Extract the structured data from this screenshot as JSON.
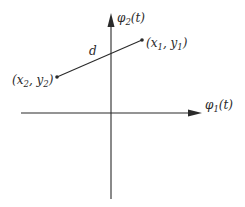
{
  "diagram": {
    "type": "signal-space-2d",
    "axes": {
      "horizontal": {
        "label_base": "φ",
        "label_sub": "1",
        "label_arg": "(t)",
        "from": [
          21,
          113
        ],
        "to": [
          202,
          113
        ]
      },
      "vertical": {
        "label_base": "φ",
        "label_sub": "2",
        "label_arg": "(t)",
        "from": [
          111,
          199
        ],
        "to": [
          111,
          13
        ]
      }
    },
    "points": [
      {
        "id": "p1",
        "label_open": "(",
        "x_base": "x",
        "x_sub": "1",
        "sep": ", ",
        "y_base": "y",
        "y_sub": "1",
        "label_close": ")",
        "pos": [
          142,
          40
        ]
      },
      {
        "id": "p2",
        "label_open": "(",
        "x_base": "x",
        "x_sub": "2",
        "sep": ", ",
        "y_base": "y",
        "y_sub": "2",
        "label_close": ")",
        "pos": [
          57,
          77
        ]
      }
    ],
    "segment": {
      "label": "d",
      "from": "p2",
      "to": "p1"
    },
    "colors": {
      "stroke": "#2a2a2a",
      "background": "#ffffff"
    }
  }
}
